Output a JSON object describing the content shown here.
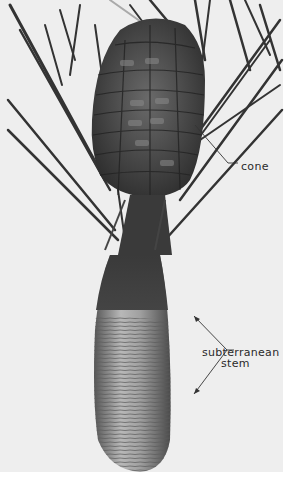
{
  "figure": {
    "background_color": "#eeeeee",
    "labels": {
      "cone": "cone",
      "subterranean_stem_line1": "subterranean",
      "subterranean_stem_line2": "stem"
    }
  }
}
